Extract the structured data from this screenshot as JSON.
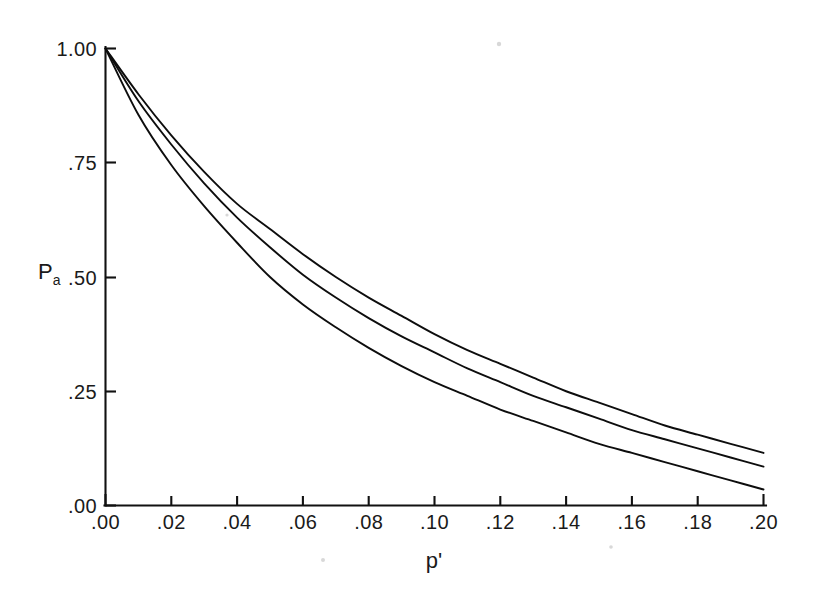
{
  "figure": {
    "background_color": "#ffffff",
    "ink_color": "#111111"
  },
  "chart_data": {
    "type": "line",
    "title": "",
    "subtitle": "",
    "xlabel": "p'",
    "ylabel": "Pa",
    "xlim": [
      0.0,
      0.2
    ],
    "ylim": [
      0.0,
      1.0
    ],
    "grid": false,
    "legend": "none",
    "xticks": [
      0.0,
      0.02,
      0.04,
      0.06,
      0.08,
      0.1,
      0.12,
      0.14,
      0.16,
      0.18,
      0.2
    ],
    "xtick_labels": [
      ".00",
      ".02",
      ".04",
      ".06",
      ".08",
      ".10",
      ".12",
      ".14",
      ".16",
      ".18",
      ".20"
    ],
    "yticks": [
      0.0,
      0.25,
      0.5,
      0.75,
      1.0
    ],
    "ytick_labels": [
      ".00",
      ".25",
      ".50",
      ".75",
      "1.00"
    ],
    "x": [
      0.0,
      0.01,
      0.02,
      0.03,
      0.04,
      0.05,
      0.06,
      0.07,
      0.08,
      0.09,
      0.1,
      0.11,
      0.12,
      0.13,
      0.14,
      0.15,
      0.16,
      0.17,
      0.18,
      0.19,
      0.2
    ],
    "series": [
      {
        "name": "upper-curve",
        "values": [
          1.0,
          0.9,
          0.81,
          0.73,
          0.66,
          0.605,
          0.55,
          0.5,
          0.455,
          0.415,
          0.375,
          0.34,
          0.31,
          0.28,
          0.25,
          0.225,
          0.2,
          0.175,
          0.155,
          0.135,
          0.115
        ]
      },
      {
        "name": "middle-curve",
        "values": [
          1.0,
          0.885,
          0.79,
          0.705,
          0.63,
          0.565,
          0.505,
          0.455,
          0.41,
          0.37,
          0.335,
          0.3,
          0.27,
          0.24,
          0.215,
          0.19,
          0.165,
          0.145,
          0.125,
          0.105,
          0.085
        ]
      },
      {
        "name": "lower-curve",
        "values": [
          1.0,
          0.855,
          0.745,
          0.655,
          0.575,
          0.5,
          0.44,
          0.39,
          0.345,
          0.305,
          0.27,
          0.24,
          0.21,
          0.185,
          0.16,
          0.135,
          0.115,
          0.095,
          0.075,
          0.055,
          0.035
        ]
      }
    ],
    "annotations": []
  }
}
